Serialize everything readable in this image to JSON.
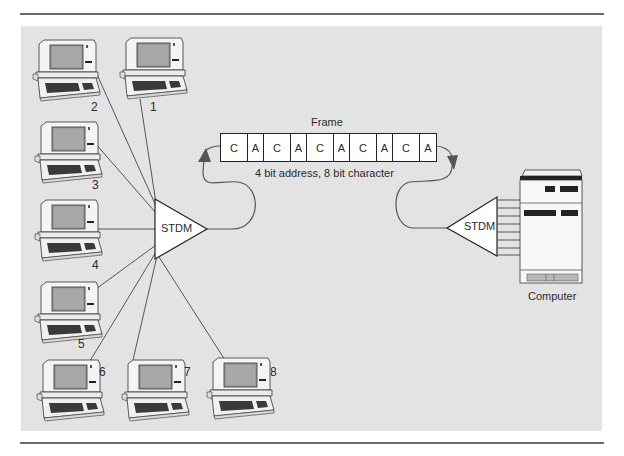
{
  "frame": {
    "title": "Frame",
    "caption": "4 bit address, 8 bit character",
    "cells": [
      {
        "label": "C",
        "kind": "character"
      },
      {
        "label": "A",
        "kind": "address"
      },
      {
        "label": "C",
        "kind": "character"
      },
      {
        "label": "A",
        "kind": "address"
      },
      {
        "label": "C",
        "kind": "character"
      },
      {
        "label": "A",
        "kind": "address"
      },
      {
        "label": "C",
        "kind": "character"
      },
      {
        "label": "A",
        "kind": "address"
      },
      {
        "label": "C",
        "kind": "character"
      },
      {
        "label": "A",
        "kind": "address"
      }
    ]
  },
  "multiplexers": {
    "left": {
      "label": "STDM"
    },
    "right": {
      "label": "STDM"
    }
  },
  "computer": {
    "label": "Computer"
  },
  "terminals": [
    {
      "id": "1",
      "label": "1"
    },
    {
      "id": "2",
      "label": "2"
    },
    {
      "id": "3",
      "label": "3"
    },
    {
      "id": "4",
      "label": "4"
    },
    {
      "id": "5",
      "label": "5"
    },
    {
      "id": "6",
      "label": "6"
    },
    {
      "id": "7",
      "label": "7"
    },
    {
      "id": "8",
      "label": "8"
    }
  ],
  "colors": {
    "panel": "#e3e3e3",
    "line": "#555555",
    "rule": "#6a6a6a"
  }
}
